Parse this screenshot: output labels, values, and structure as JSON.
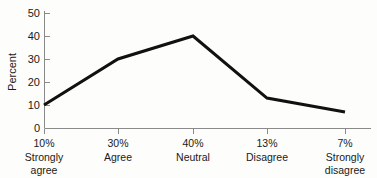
{
  "chart_data": {
    "type": "line",
    "title": "",
    "xlabel": "",
    "ylabel": "Percent",
    "ylim": [
      0,
      50
    ],
    "yticks": [
      0,
      10,
      20,
      30,
      40,
      50
    ],
    "ytick_labels": [
      "0",
      "10",
      "20",
      "30",
      "40",
      "50"
    ],
    "grid": false,
    "legend": false,
    "categories": [
      "Strongly agree",
      "Agree",
      "Neutral",
      "Disagree",
      "Strongly disagree"
    ],
    "category_lines": [
      [
        "Strongly",
        "agree"
      ],
      [
        "Agree",
        ""
      ],
      [
        "Neutral",
        ""
      ],
      [
        "Disagree",
        ""
      ],
      [
        "Strongly",
        "disagree"
      ]
    ],
    "xtick_labels": [
      "10%",
      "30%",
      "40%",
      "13%",
      "7%"
    ],
    "values": [
      10,
      30,
      40,
      13,
      7
    ],
    "series": [
      {
        "name": "Percent",
        "values": [
          10,
          30,
          40,
          13,
          7
        ]
      }
    ],
    "line_color": "#111111",
    "axis_color": "#8a8a8a",
    "background_color": "#fdfdfb"
  },
  "axis": {
    "y_label": "Percent",
    "y_ticks": [
      {
        "value": "50"
      },
      {
        "value": "40"
      },
      {
        "value": "30"
      },
      {
        "value": "20"
      },
      {
        "value": "10"
      },
      {
        "value": "0"
      }
    ],
    "x_ticks": [
      {
        "pct": "10%",
        "line1": "Strongly",
        "line2": "agree"
      },
      {
        "pct": "30%",
        "line1": "Agree",
        "line2": ""
      },
      {
        "pct": "40%",
        "line1": "Neutral",
        "line2": ""
      },
      {
        "pct": "13%",
        "line1": "Disagree",
        "line2": ""
      },
      {
        "pct": "7%",
        "line1": "Strongly",
        "line2": "disagree"
      }
    ]
  }
}
